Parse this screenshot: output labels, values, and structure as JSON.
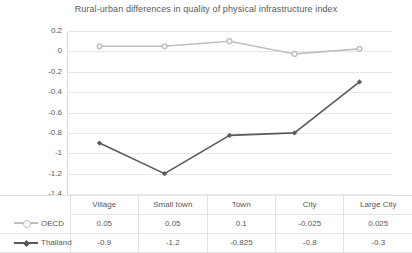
{
  "chart_data": {
    "type": "line",
    "title": "Rural-urban differences in quality of physical infrastructure index",
    "xlabel": "",
    "ylabel": "",
    "ylim": [
      -1.4,
      0.2
    ],
    "ytick_step": 0.2,
    "grid": true,
    "legend_position": "table-left",
    "categories": [
      "Village",
      "Small town",
      "Town",
      "City",
      "Large City"
    ],
    "yticks": [
      "0.2",
      "0",
      "-0.2",
      "-0.4",
      "-0.6",
      "-0.8",
      "-1",
      "-1.2",
      "-1.4"
    ],
    "ytick_values": [
      0.2,
      0,
      -0.2,
      -0.4,
      -0.6,
      -0.8,
      -1,
      -1.2,
      -1.4
    ],
    "series": [
      {
        "name": "OECD",
        "color": "#bfbfbf",
        "marker": "circle",
        "values": [
          0.05,
          0.05,
          0.1,
          -0.025,
          0.025
        ],
        "labels": [
          "0.05",
          "0.05",
          "0.1",
          "-0.025",
          "0.025"
        ]
      },
      {
        "name": "Thailand",
        "color": "#595959",
        "marker": "diamond",
        "values": [
          -0.9,
          -1.2,
          -0.825,
          -0.8,
          -0.3
        ],
        "labels": [
          "-0.9",
          "-1.2",
          "-0.825",
          "-0.8",
          "-0.3"
        ]
      }
    ]
  },
  "table": {
    "corner": "",
    "columns": [
      "Village",
      "Small town",
      "Town",
      "City",
      "Large City"
    ],
    "rows": [
      {
        "label": "OECD",
        "values": [
          "0.05",
          "0.05",
          "0.1",
          "-0.025",
          "0.025"
        ]
      },
      {
        "label": "Thailand",
        "values": [
          "-0.9",
          "-1.2",
          "-0.825",
          "-0.8",
          "-0.3"
        ]
      }
    ]
  }
}
